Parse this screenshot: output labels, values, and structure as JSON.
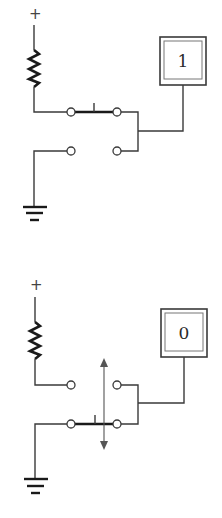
{
  "diagrams": [
    {
      "name": "switch-up-state",
      "supply_symbol": "+",
      "output_value": "1",
      "switch_position": "upper",
      "show_motion_arrow": false
    },
    {
      "name": "switch-down-state",
      "supply_symbol": "+",
      "output_value": "0",
      "switch_position": "lower",
      "show_motion_arrow": true
    }
  ],
  "colors": {
    "wire": "#3a3a3a",
    "background": "#ffffff"
  }
}
